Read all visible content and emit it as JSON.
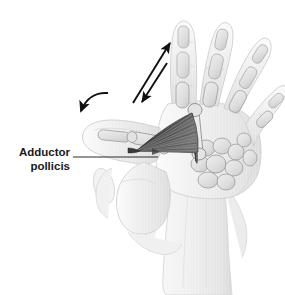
{
  "figure": {
    "kind": "anatomical-illustration",
    "background_color": "#ffffff",
    "width": 285,
    "height": 295
  },
  "labels": [
    {
      "id": "adductor-pollicis",
      "line1": "Adductor",
      "line2": "pollicis",
      "text_color": "#1a1a1a",
      "anchor_x": 70,
      "anchor_y": 152,
      "leader_from_x": 73,
      "leader_from_y": 157,
      "leader_to_x": 158,
      "leader_to_y": 157,
      "leader_color": "#2a2a2a"
    }
  ],
  "annotations": {
    "straight_arrows": [
      {
        "id": "adduction-arrow-up",
        "direction": "up-right",
        "x1": 133,
        "y1": 103,
        "x2": 170,
        "y2": 43,
        "color": "#111111",
        "head": "end"
      },
      {
        "id": "adduction-arrow-down",
        "direction": "down-left",
        "x1": 167,
        "y1": 63,
        "x2": 142,
        "y2": 102,
        "color": "#111111",
        "head": "end"
      }
    ],
    "curved_arrows": [
      {
        "id": "thumb-rotation-arrow",
        "direction": "counterclockwise-down-left",
        "color": "#111111",
        "path": "M 108 93 C 96 92 86 98 81 111",
        "head_x": 80,
        "head_y": 114
      }
    ]
  },
  "anatomy": {
    "muscle": {
      "name": "adductor pollicis",
      "shape": "fan / triangular, striated",
      "apex_x": 136,
      "apex_y": 151,
      "fill_dark": "#454545",
      "fill_mid": "#5e5e5e",
      "fill_light": "#7a7a7a",
      "fiber_color": "#8d8d8d",
      "fiber_count": 15
    },
    "skin": {
      "fill": "#f2f2f2",
      "fill_shadow": "#e2e2e2",
      "outline": "#cfcfcf",
      "outline_dark": "#b9b9b9"
    },
    "bone": {
      "fill": "#e6e6e6",
      "fill_shade": "#d3d3d3",
      "outline": "#9a9a9a"
    },
    "fingers": [
      {
        "id": "index-finger",
        "segments": 3
      },
      {
        "id": "middle-finger",
        "segments": 3
      },
      {
        "id": "ring-finger",
        "segments": 3
      },
      {
        "id": "little-finger",
        "segments": 3
      }
    ],
    "thumb": {
      "id": "thumb",
      "segments": 2,
      "position": "abducted-left"
    },
    "carpals": {
      "id": "carpal-bones",
      "count": 8
    },
    "forearm": {
      "id": "forearm-wrist",
      "fill": "#f0f0f0"
    }
  }
}
